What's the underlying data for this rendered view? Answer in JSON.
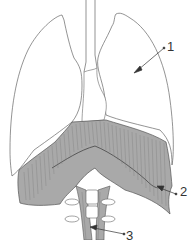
{
  "diagram": {
    "colors": {
      "outline": "#666666",
      "muscle_fill": "#a9a9a9",
      "muscle_fiber": "#7a7a7a",
      "lung_fill": "#ffffff",
      "background": "#ffffff",
      "label_text": "#333333"
    },
    "labels": [
      {
        "number": "1",
        "target": "lung",
        "text": "1"
      },
      {
        "number": "2",
        "target": "diaphragm",
        "text": "2"
      },
      {
        "number": "3",
        "target": "crus-of-diaphragm",
        "text": "3"
      }
    ]
  }
}
